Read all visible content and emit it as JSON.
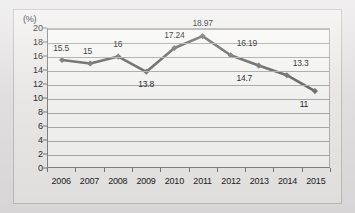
{
  "chart_data": {
    "type": "line",
    "title": "",
    "xlabel": "",
    "ylabel": "(%)",
    "unit_label": "(%)",
    "categories": [
      "2006",
      "2007",
      "2008",
      "2009",
      "2010",
      "2011",
      "2012",
      "2013",
      "2014",
      "2015"
    ],
    "values": [
      15.5,
      15,
      16,
      13.8,
      17.24,
      18.97,
      16.19,
      14.7,
      13.3,
      11
    ],
    "point_labels": [
      "15.5",
      "15",
      "16",
      "13.8",
      "17.24",
      "18.97",
      "16.19",
      "14.7",
      "13.3",
      "11"
    ],
    "label_placement": [
      "above",
      "above",
      "above",
      "below",
      "above",
      "above",
      "above",
      "below",
      "above",
      "below"
    ],
    "ylim": [
      0,
      20
    ],
    "ytick_step": 2,
    "yticks": [
      "20",
      "18",
      "16",
      "14",
      "12",
      "10",
      "8",
      "6",
      "4",
      "2",
      "0"
    ],
    "grid": true,
    "legend": "none",
    "series": [
      {
        "name": "",
        "values": [
          15.5,
          15,
          16,
          13.8,
          17.24,
          18.97,
          16.19,
          14.7,
          13.3,
          11
        ]
      }
    ],
    "line_color": "#6b6b6b",
    "marker_color": "#767676",
    "marker_shape": "diamond",
    "plot_background": "#fdfdfc",
    "gridline_color": "#b3b0ae",
    "axis_color": "#8a8886",
    "text_color": "#232323",
    "page_background": "#eceaea"
  }
}
